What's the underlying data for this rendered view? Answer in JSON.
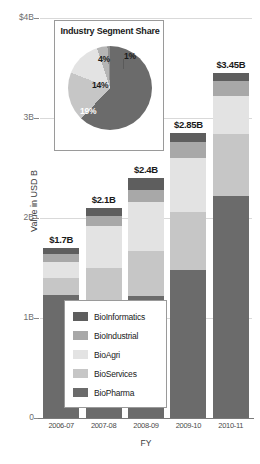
{
  "chart_data": {
    "type": "bar",
    "title": "",
    "xlabel": "FY",
    "ylabel": "Value in USD B",
    "categories": [
      "2006-07",
      "2007-08",
      "2008-09",
      "2009-10",
      "2010-11"
    ],
    "ylim": [
      0,
      4
    ],
    "ytick_labels": [
      "0",
      "1B",
      "2B",
      "3B",
      "$4B"
    ],
    "ytick_values": [
      0,
      1,
      2,
      3,
      4
    ],
    "grid": true,
    "stacked": true,
    "legend_position": "center",
    "bar_totals": [
      "$1.7B",
      "$2.1B",
      "$2.4B",
      "$2.85B",
      "$3.45B"
    ],
    "bar_total_values": [
      1.7,
      2.1,
      2.4,
      2.85,
      3.45
    ],
    "series": [
      {
        "name": "BioPharma",
        "color": "#6b6b6b",
        "values": [
          1.23,
          1.05,
          1.22,
          1.48,
          2.22
        ]
      },
      {
        "name": "BioServices",
        "color": "#c6c6c6",
        "values": [
          0.17,
          0.45,
          0.45,
          0.58,
          0.62
        ]
      },
      {
        "name": "BioAgri",
        "color": "#e3e3e3",
        "values": [
          0.16,
          0.42,
          0.49,
          0.54,
          0.38
        ]
      },
      {
        "name": "BioIndustrial",
        "color": "#a8a8a8",
        "values": [
          0.08,
          0.1,
          0.12,
          0.16,
          0.15
        ]
      },
      {
        "name": "BioInformatics",
        "color": "#5e5e5e",
        "values": [
          0.06,
          0.08,
          0.12,
          0.09,
          0.08
        ]
      }
    ],
    "inset_pie": {
      "title": "Industry Segment Share",
      "type": "pie",
      "labels": [
        "62%",
        "19%",
        "14%",
        "4%",
        "1%"
      ],
      "values": [
        62,
        19,
        14,
        4,
        1
      ],
      "colors": [
        "#6b6b6b",
        "#c6c6c6",
        "#e3e3e3",
        "#b5b5b5",
        "#8f8f8f"
      ]
    }
  },
  "axes": {
    "ylabel": "Value in USD B",
    "xlabel": "FY",
    "yticks": [
      {
        "label": "$4B",
        "value": 4
      },
      {
        "label": "3B",
        "value": 3
      },
      {
        "label": "2B",
        "value": 2
      },
      {
        "label": "1B",
        "value": 1
      },
      {
        "label": "0",
        "value": 0
      }
    ],
    "xticks": [
      "2006-07",
      "2007-08",
      "2008-09",
      "2009-10",
      "2010-11"
    ]
  },
  "bars": [
    {
      "category": "2006-07",
      "total_label": "$1.7B"
    },
    {
      "category": "2007-08",
      "total_label": "$2.1B"
    },
    {
      "category": "2008-09",
      "total_label": "$2.4B"
    },
    {
      "category": "2009-10",
      "total_label": "$2.85B"
    },
    {
      "category": "2010-11",
      "total_label": "$3.45B"
    }
  ],
  "legend": {
    "items": [
      {
        "label": "BioInformatics",
        "color": "#5e5e5e"
      },
      {
        "label": "BioIndustrial",
        "color": "#a8a8a8"
      },
      {
        "label": "BioAgri",
        "color": "#e3e3e3"
      },
      {
        "label": "BioServices",
        "color": "#c6c6c6"
      },
      {
        "label": "BioPharma",
        "color": "#6b6b6b"
      }
    ]
  },
  "inset": {
    "title": "Industry Segment Share",
    "slices": [
      {
        "label": "62%",
        "value": 62,
        "color": "#6b6b6b"
      },
      {
        "label": "19%",
        "value": 19,
        "color": "#c6c6c6"
      },
      {
        "label": "14%",
        "value": 14,
        "color": "#e3e3e3"
      },
      {
        "label": "4%",
        "value": 4,
        "color": "#b5b5b5"
      },
      {
        "label": "1%",
        "value": 1,
        "color": "#8f8f8f"
      }
    ]
  }
}
